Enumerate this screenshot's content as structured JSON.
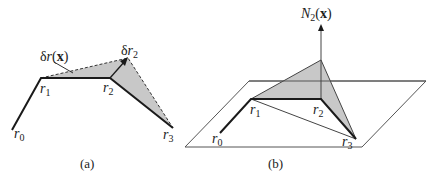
{
  "panel_a": {
    "caption": "(a)",
    "labels": {
      "r0": "r",
      "r0_sub": "0",
      "r1": "r",
      "r1_sub": "1",
      "r2": "r",
      "r2_sub": "2",
      "r3": "r",
      "r3_sub": "3",
      "delta_r_x_pre": "δ",
      "delta_r_x_r": "r",
      "delta_r_x_open": "(",
      "delta_r_x_x": "x",
      "delta_r_x_close": ")",
      "delta_r2_pre": "δ",
      "delta_r2_r": "r",
      "delta_r2_sub": "2"
    }
  },
  "panel_b": {
    "caption": "(b)",
    "labels": {
      "r0": "r",
      "r0_sub": "0",
      "r1": "r",
      "r1_sub": "1",
      "r2": "r",
      "r2_sub": "2",
      "r3": "r",
      "r3_sub": "3",
      "n2_N": "N",
      "n2_sub": "2",
      "n2_open": "(",
      "n2_x": "x",
      "n2_close": ")"
    }
  },
  "colors": {
    "fill": "#c8c8c8",
    "line": "#1a1a1a",
    "plane": "#555555"
  }
}
